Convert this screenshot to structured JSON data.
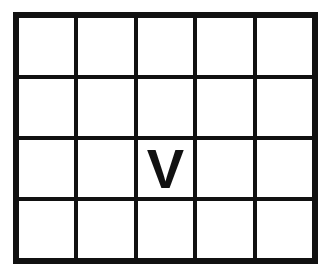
{
  "figure": {
    "name": "grid-with-letter",
    "background_color": "#ffffff",
    "border_color": "#111111",
    "line_color": "#111111",
    "border_thickness_px": 6,
    "gridline_thickness_px": 4,
    "columns": 5,
    "rows": 4
  },
  "grid": {
    "marked_cell": {
      "row": 3,
      "column": 3,
      "label": "V"
    },
    "cells": [
      [
        {
          "label": ""
        },
        {
          "label": ""
        },
        {
          "label": ""
        },
        {
          "label": ""
        },
        {
          "label": ""
        }
      ],
      [
        {
          "label": ""
        },
        {
          "label": ""
        },
        {
          "label": ""
        },
        {
          "label": ""
        },
        {
          "label": ""
        }
      ],
      [
        {
          "label": ""
        },
        {
          "label": ""
        },
        {
          "label": "V"
        },
        {
          "label": ""
        },
        {
          "label": ""
        }
      ],
      [
        {
          "label": ""
        },
        {
          "label": ""
        },
        {
          "label": ""
        },
        {
          "label": ""
        },
        {
          "label": ""
        }
      ]
    ]
  }
}
